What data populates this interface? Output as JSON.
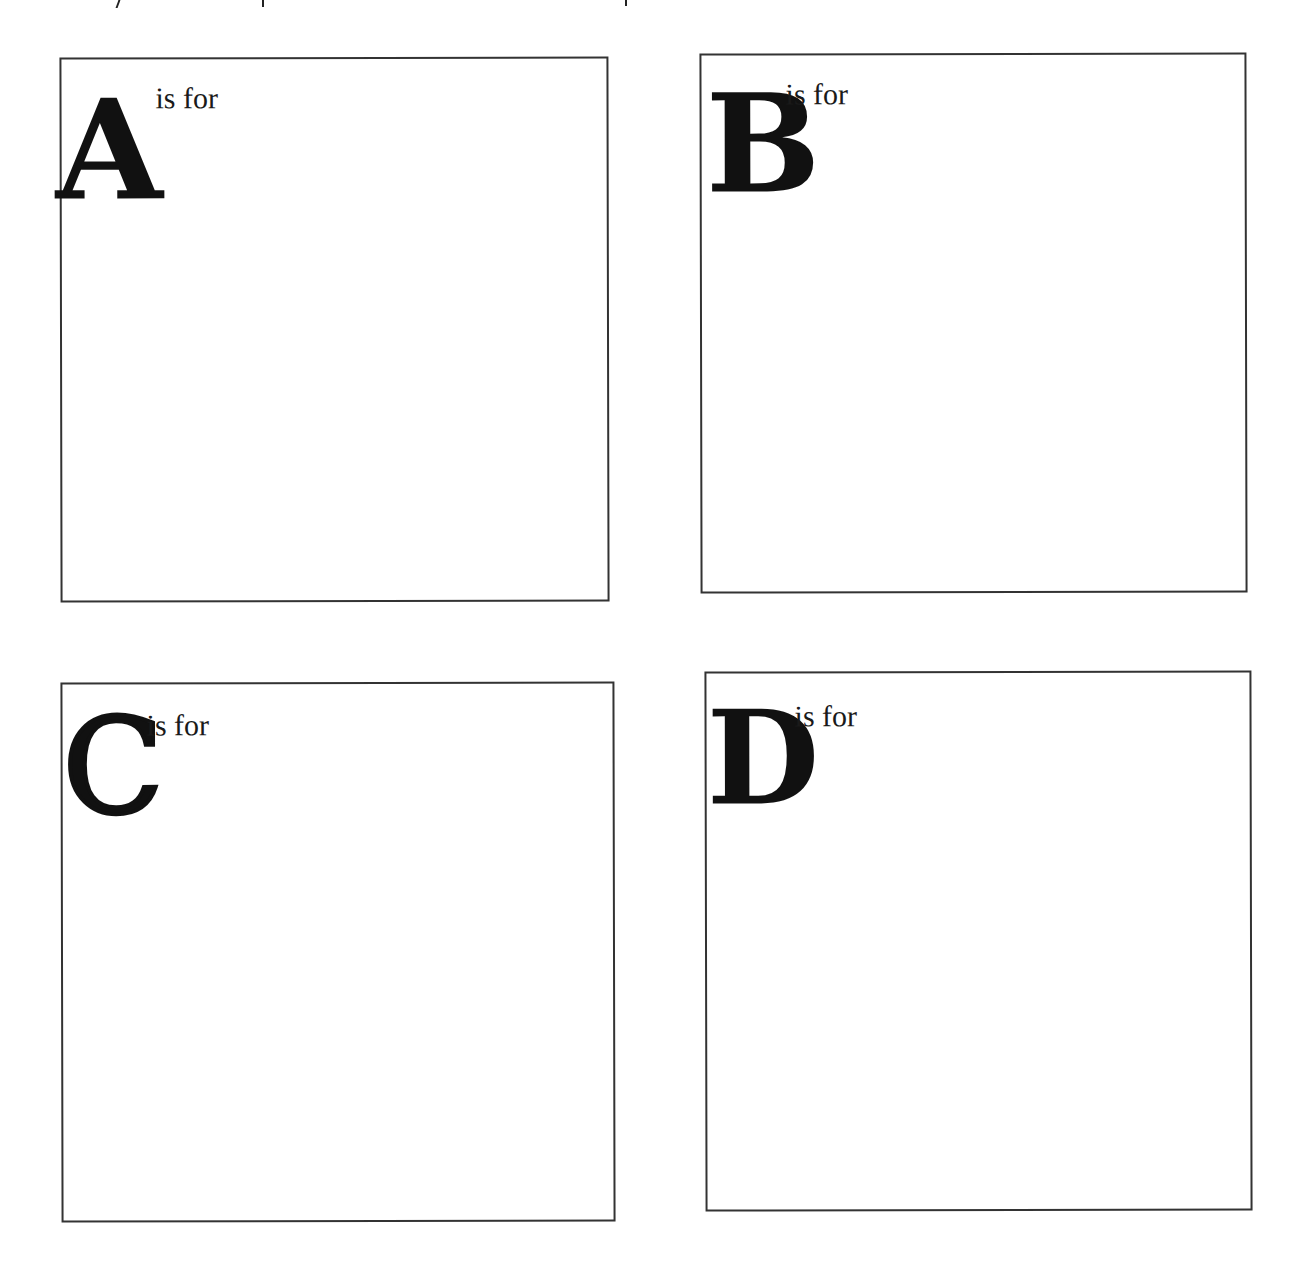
{
  "page": {
    "background": "#ffffff",
    "border_color": "#333333",
    "text_color": "#111111"
  },
  "boxes": [
    {
      "letter": "A",
      "caption": "is for"
    },
    {
      "letter": "B",
      "caption": "is for"
    },
    {
      "letter": "C",
      "caption": "is for"
    },
    {
      "letter": "D",
      "caption": "is for"
    }
  ]
}
